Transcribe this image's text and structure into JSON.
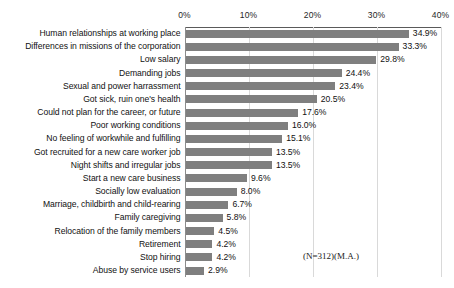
{
  "chart_data": {
    "type": "bar",
    "orientation": "horizontal",
    "title": "",
    "xlabel": "",
    "ylabel": "",
    "xlim": [
      0,
      40
    ],
    "xticks": [
      "0%",
      "10%",
      "20%",
      "30%",
      "40%"
    ],
    "xtick_values": [
      0,
      10,
      20,
      30,
      40
    ],
    "grid": true,
    "legend": "none",
    "bar_color": "#7f7f7f",
    "value_suffix": "%",
    "categories": [
      "Human relationships at working place",
      "Differences in missions of the corporation",
      "Low salary",
      "Demanding jobs",
      "Sexual and power harrassment",
      "Got sick, ruin one's health",
      "Could not plan for the career, or future",
      "Poor working conditions",
      "No feeling of workwhile and fulfilling",
      "Got recruited for a new care worker job",
      "Night shifts and irregular jobs",
      "Start a new care business",
      "Socially low evaluation",
      "Marriage, childbirth and child-rearing",
      "Family caregiving",
      "Relocation of the family members",
      "Retirement",
      "Stop hiring",
      "Abuse by service users"
    ],
    "values": [
      34.9,
      33.3,
      29.8,
      24.4,
      23.4,
      20.5,
      17.6,
      16.0,
      15.1,
      13.5,
      13.5,
      9.6,
      8.0,
      6.7,
      5.8,
      4.5,
      4.2,
      4.2,
      2.9
    ],
    "value_labels": [
      "34.9%",
      "33.3%",
      "29.8%",
      "24.4%",
      "23.4%",
      "20.5%",
      "17.6%",
      "16.0%",
      "15.1%",
      "13.5%",
      "13.5%",
      "9.6%",
      "8.0%",
      "6.7%",
      "5.8%",
      "4.5%",
      "4.2%",
      "4.2%",
      "2.9%"
    ],
    "annotation": "(N=312)(M.A.)"
  }
}
